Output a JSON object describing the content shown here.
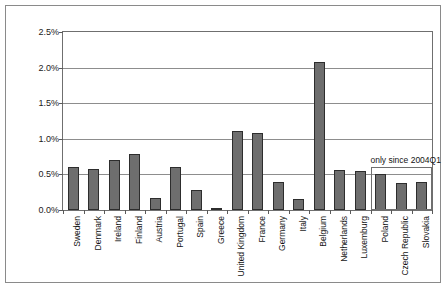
{
  "chart_data": {
    "type": "bar",
    "title": "",
    "xlabel": "",
    "ylabel": "Share [%]",
    "ylim": [
      0,
      2.5
    ],
    "ytick_labels": [
      "0.0%",
      "0.5%",
      "1.0%",
      "1.5%",
      "2.0%",
      "2.5%"
    ],
    "ytick_values": [
      0.0,
      0.5,
      1.0,
      1.5,
      2.0,
      2.5
    ],
    "grid": true,
    "legend": "none",
    "categories": [
      "Sweden",
      "Denmark",
      "Ireland",
      "Finland",
      "Austria",
      "Portugal",
      "Spain",
      "Greece",
      "United Kingdom",
      "France",
      "Germany",
      "Italy",
      "Belgium",
      "Netherlands",
      "Luxemburg",
      "Poland",
      "Czech Republic",
      "Slovakia"
    ],
    "values": [
      0.61,
      0.58,
      0.7,
      0.79,
      0.17,
      0.6,
      0.28,
      0.03,
      1.11,
      1.08,
      0.4,
      0.15,
      2.08,
      0.56,
      0.55,
      0.5,
      0.38,
      0.4
    ],
    "annotations": [
      {
        "text": "only since 2004Q1",
        "covers": [
          "Poland",
          "Czech Republic",
          "Slovakia"
        ],
        "from_index": 15,
        "to_index": 17
      }
    ],
    "colors": {
      "bar_fill": "#6e6e6e",
      "bar_edge": "#2d2d2d",
      "grid": "#8d8d8d",
      "axis": "#6f6f6f",
      "frame": "#8a8a8a",
      "text": "#141414",
      "background": "#ffffff"
    }
  }
}
